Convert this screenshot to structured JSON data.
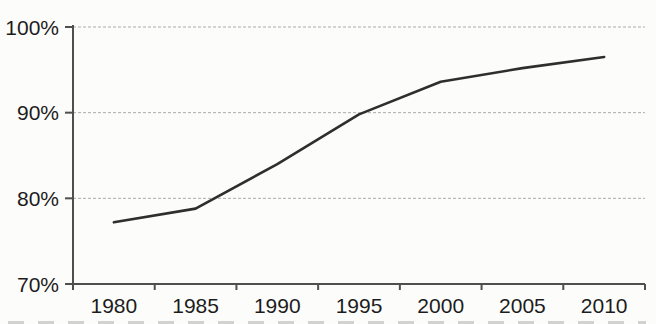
{
  "chart_data": {
    "type": "line",
    "title": "",
    "xlabel": "",
    "ylabel": "",
    "categories": [
      "1980",
      "1985",
      "1990",
      "1995",
      "2000",
      "2005",
      "2010"
    ],
    "series": [
      {
        "name": "percentage",
        "values": [
          77.2,
          78.8,
          84.0,
          89.8,
          93.6,
          95.2,
          96.5
        ]
      }
    ],
    "ylim": [
      70,
      100
    ],
    "yticks": [
      {
        "value": 70,
        "label": "70%"
      },
      {
        "value": 80,
        "label": "80%"
      },
      {
        "value": 90,
        "label": "90%"
      },
      {
        "value": 100,
        "label": "100%"
      }
    ],
    "grid": true,
    "gridline_style": "dashed",
    "legend_position": "none",
    "colors": {
      "line": "#2e2e2e",
      "gridline": "#ababab",
      "axis": "#4f4f4f",
      "label": "#1c1c1c",
      "background": "#fcfcfb"
    }
  }
}
